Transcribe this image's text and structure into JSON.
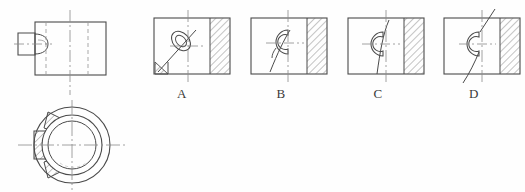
{
  "figure": {
    "kind": "engineering-drawing-multiple-choice",
    "background_color": "#fefefe",
    "line_color": "#4a4a4a",
    "hatch_color": "#6b6b6b",
    "center_line_color": "#8a8a8a",
    "hidden_line_color": "#9a9a9a",
    "label_color": "#3a3a3a"
  },
  "given_views": {
    "front_view": {
      "name": "front-view",
      "description": "Rectangular block with cylindrical boss on left side, hidden lines shown dashed",
      "rect": {
        "x": 35,
        "y": 22,
        "width": 71,
        "height": 53
      },
      "boss": {
        "x": 18,
        "y": 33,
        "width": 18,
        "height": 22
      }
    },
    "top_view": {
      "name": "top-view",
      "description": "Circular section with concentric bore and hatched keyway boss on left",
      "center": {
        "cx": 72,
        "cy": 145
      },
      "outer_radius": 38,
      "bore_radius": 27,
      "inner_radius": 22
    }
  },
  "options": [
    {
      "id": "A",
      "label": "A",
      "name": "option-a",
      "rect": {
        "x": 154,
        "y": 18,
        "width": 76,
        "height": 56
      },
      "hatch_band": {
        "x": 210,
        "width": 20
      },
      "description": "Section view with diagonal cutting line from lower-left and partial circular feature"
    },
    {
      "id": "B",
      "label": "B",
      "name": "option-b",
      "rect": {
        "x": 251,
        "y": 18,
        "width": 76,
        "height": 56
      },
      "hatch_band": {
        "x": 307,
        "width": 20
      },
      "description": "Section view with break line curving to lower-left and C-shaped bore outline"
    },
    {
      "id": "C",
      "label": "C",
      "name": "option-c",
      "rect": {
        "x": 348,
        "y": 18,
        "width": 76,
        "height": 56
      },
      "hatch_band": {
        "x": 404,
        "width": 20
      },
      "description": "Section view with vertical break line through center and C-shaped bore outline"
    },
    {
      "id": "D",
      "label": "D",
      "name": "option-d",
      "rect": {
        "x": 444,
        "y": 18,
        "width": 76,
        "height": 56
      },
      "hatch_band": {
        "x": 500,
        "width": 20
      },
      "description": "Section view with break line extending beyond the outline top and bottom"
    }
  ]
}
